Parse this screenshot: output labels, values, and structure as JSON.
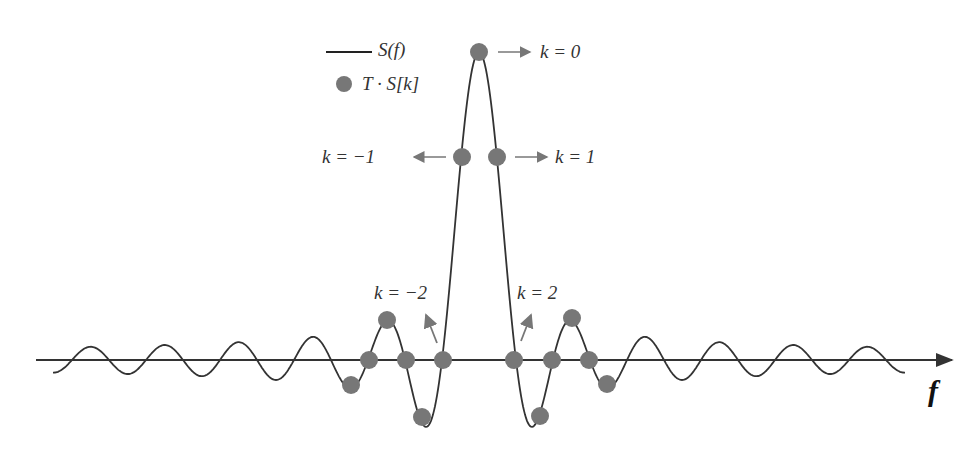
{
  "legend": {
    "line_label": "S(f)",
    "marker_label": "T · S[k]"
  },
  "axis": {
    "label": "f"
  },
  "annotations": {
    "k0": "k = 0",
    "k_neg1": "k = −1",
    "k_pos1": "k = 1",
    "k_neg2": "k = −2",
    "k_pos2": "k = 2"
  },
  "colors": {
    "curve": "#333333",
    "marker": "#777777",
    "arrow": "#777777",
    "axis": "#333333"
  },
  "chart_data": {
    "type": "line",
    "title": "",
    "xlabel": "f",
    "ylabel": "",
    "series": [
      {
        "name": "S(f)",
        "kind": "continuous sinc curve"
      },
      {
        "name": "T · S[k]",
        "kind": "samples",
        "k": [
          -6,
          -5,
          -4,
          -3,
          -2,
          -1,
          0,
          1,
          2,
          3,
          4,
          5,
          6
        ],
        "values": [
          -0.08,
          0,
          0.13,
          0,
          -0.2,
          0,
          1.0,
          0,
          -0.2,
          0,
          0.13,
          0,
          -0.08
        ]
      }
    ]
  }
}
